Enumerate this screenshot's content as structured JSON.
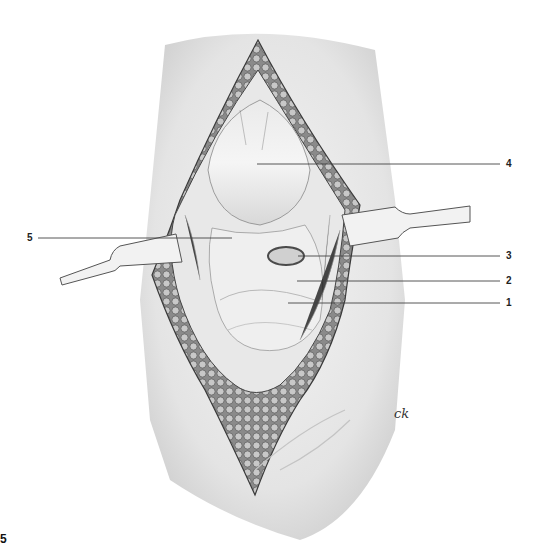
{
  "figure": {
    "number": "5",
    "signature": "CK",
    "labels": [
      {
        "id": "1",
        "text": "1",
        "x": 506,
        "y": 303,
        "line_start": [
          288,
          303
        ],
        "line_end": [
          500,
          303
        ]
      },
      {
        "id": "2",
        "text": "2",
        "x": 506,
        "y": 281,
        "line_start": [
          297,
          281
        ],
        "line_end": [
          500,
          281
        ]
      },
      {
        "id": "3",
        "text": "3",
        "x": 506,
        "y": 256,
        "line_start": [
          298,
          256
        ],
        "line_end": [
          500,
          256
        ]
      },
      {
        "id": "4",
        "text": "4",
        "x": 506,
        "y": 164,
        "line_start": [
          257,
          164
        ],
        "line_end": [
          500,
          164
        ]
      },
      {
        "id": "5",
        "text": "5",
        "x": 27,
        "y": 238,
        "line_start": [
          38,
          238
        ],
        "line_end": [
          232,
          238
        ]
      }
    ]
  },
  "colors": {
    "skin": "#ececec",
    "skin_shade": "#d6d6d6",
    "fat": "#9a9a9a",
    "tissue": "#e2e2e2",
    "outline": "#4a4a4a",
    "leader": "#444444"
  }
}
